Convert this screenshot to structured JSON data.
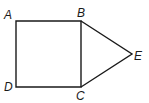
{
  "figure": {
    "stroke_color": "#1a1a1a",
    "points": {
      "A": {
        "label": "A",
        "x": 16,
        "y": 21
      },
      "B": {
        "label": "B",
        "x": 81,
        "y": 21
      },
      "C": {
        "label": "C",
        "x": 81,
        "y": 87
      },
      "D": {
        "label": "D",
        "x": 16,
        "y": 87
      },
      "E": {
        "label": "E",
        "x": 132,
        "y": 54
      }
    },
    "segments": [
      "AB",
      "BC",
      "CD",
      "DA",
      "BE",
      "CE"
    ]
  }
}
